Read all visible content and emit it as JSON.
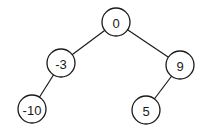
{
  "diagram": {
    "type": "binary-tree",
    "stroke_color": "#1a1a1a",
    "background": "#ffffff",
    "node_radius": 14,
    "nodes": [
      {
        "id": "n0",
        "label": "0",
        "x": 116,
        "y": 22
      },
      {
        "id": "n1",
        "label": "-3",
        "x": 61,
        "y": 63
      },
      {
        "id": "n2",
        "label": "9",
        "x": 180,
        "y": 65
      },
      {
        "id": "n3",
        "label": "-10",
        "x": 32,
        "y": 109
      },
      {
        "id": "n4",
        "label": "5",
        "x": 146,
        "y": 110
      }
    ],
    "edges": [
      {
        "from": "n0",
        "to": "n1"
      },
      {
        "from": "n0",
        "to": "n2"
      },
      {
        "from": "n1",
        "to": "n3"
      },
      {
        "from": "n2",
        "to": "n4"
      }
    ]
  }
}
